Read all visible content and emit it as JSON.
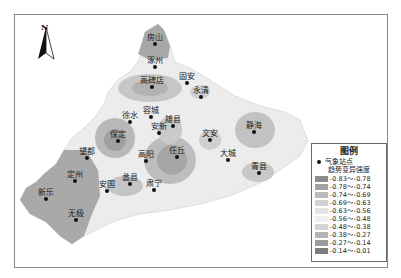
{
  "map": {
    "north_arrow": {
      "letter": "N",
      "icon": "north-arrow-icon"
    },
    "stations": [
      {
        "name": "房山",
        "x": 155,
        "y": 44
      },
      {
        "name": "涿州",
        "x": 155,
        "y": 67
      },
      {
        "name": "高碑店",
        "x": 152,
        "y": 87
      },
      {
        "name": "固安",
        "x": 187,
        "y": 83
      },
      {
        "name": "永清",
        "x": 201,
        "y": 97
      },
      {
        "name": "徐水",
        "x": 130,
        "y": 122
      },
      {
        "name": "容城",
        "x": 151,
        "y": 117
      },
      {
        "name": "雄县",
        "x": 173,
        "y": 126
      },
      {
        "name": "安新",
        "x": 159,
        "y": 133
      },
      {
        "name": "保定",
        "x": 118,
        "y": 141
      },
      {
        "name": "文安",
        "x": 210,
        "y": 140
      },
      {
        "name": "静海",
        "x": 254,
        "y": 132
      },
      {
        "name": "高阳",
        "x": 146,
        "y": 161
      },
      {
        "name": "任丘",
        "x": 177,
        "y": 157
      },
      {
        "name": "大城",
        "x": 228,
        "y": 160
      },
      {
        "name": "青县",
        "x": 259,
        "y": 173
      },
      {
        "name": "望都",
        "x": 87,
        "y": 158
      },
      {
        "name": "定州",
        "x": 75,
        "y": 181
      },
      {
        "name": "安国",
        "x": 107,
        "y": 191
      },
      {
        "name": "蠡县",
        "x": 130,
        "y": 184
      },
      {
        "name": "肃宁",
        "x": 154,
        "y": 190
      },
      {
        "name": "新乐",
        "x": 46,
        "y": 199
      },
      {
        "name": "无极",
        "x": 76,
        "y": 220
      }
    ]
  },
  "legend": {
    "title": "图例",
    "station_label": "气象站点",
    "subtitle": "趋势变异强度",
    "classes": [
      {
        "range": "-0.83～-0.78",
        "color": "#8c8c8c"
      },
      {
        "range": "-0.78～-0.74",
        "color": "#a2a2a2"
      },
      {
        "range": "-0.74～-0.69",
        "color": "#bababa"
      },
      {
        "range": "-0.69～-0.63",
        "color": "#d2d2d2"
      },
      {
        "range": "-0.63～-0.56",
        "color": "#e4e4e4"
      },
      {
        "range": "-0.56～-0.48",
        "color": "#efefef"
      },
      {
        "range": "-0.48～-0.38",
        "color": "#d4d4d4"
      },
      {
        "range": "-0.38～-0.27",
        "color": "#b4b4b4"
      },
      {
        "range": "-0.27～-0.14",
        "color": "#9c9c9c"
      },
      {
        "range": "-0.14～-0.01",
        "color": "#7c7c7c"
      }
    ]
  }
}
